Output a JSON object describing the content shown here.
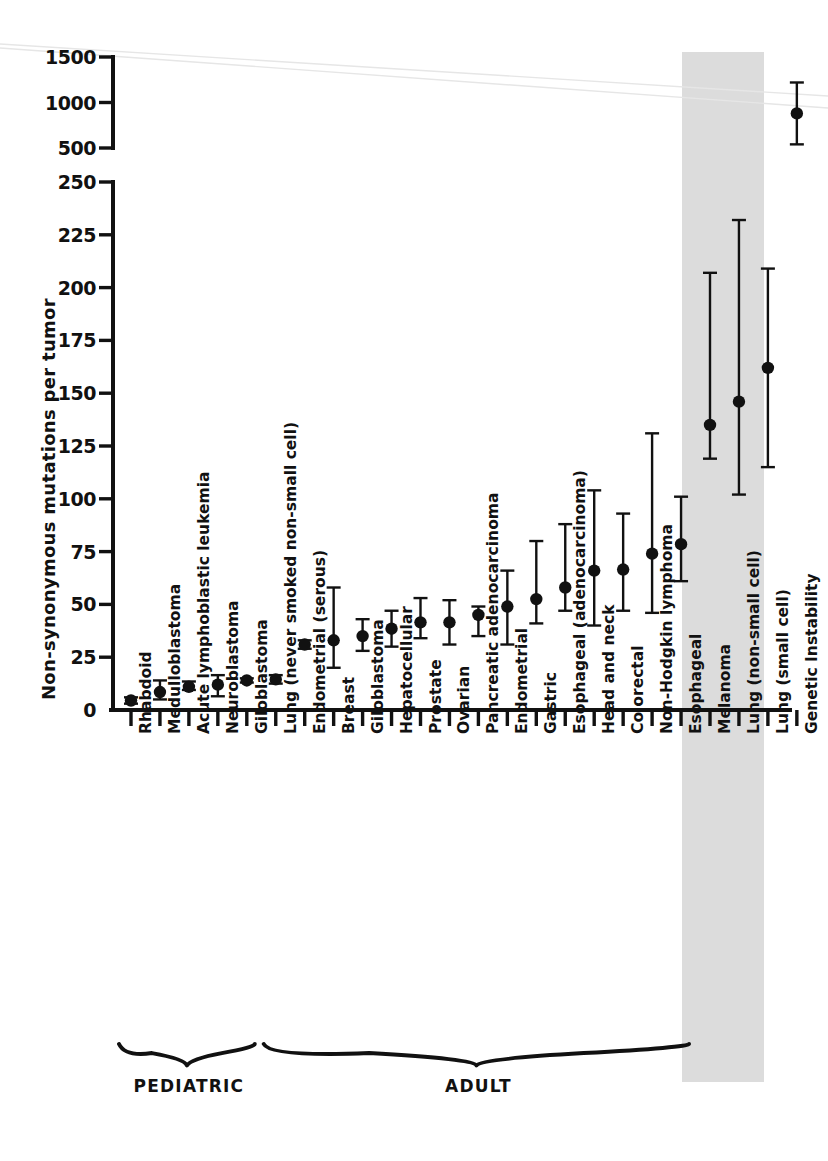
{
  "chart_data": {
    "type": "scatter",
    "title": "",
    "xlabel": "",
    "ylabel": "Non-synonymous mutations per tumor",
    "grid": false,
    "legend": "none",
    "axis_note": "broken y-axis: lower panel 0-250 (step 25), upper panel 500-1500 (step 500)",
    "lower_axis": {
      "min": 0,
      "max": 250,
      "ticks": [
        0,
        25,
        50,
        75,
        100,
        125,
        150,
        175,
        200,
        225,
        250
      ]
    },
    "upper_axis": {
      "min": 500,
      "max": 1500,
      "ticks": [
        500,
        1000,
        1500
      ]
    },
    "ytick_labels_upper": [
      "1500",
      "1000",
      "500"
    ],
    "ytick_labels_lower": [
      "250",
      "225",
      "200",
      "175",
      "150",
      "125",
      "100",
      "75",
      "50",
      "25",
      "0"
    ],
    "categories": [
      "Rhabdoid",
      "Medulloblastoma",
      "Acute lymphoblastic leukemia",
      "Neuroblastoma",
      "Giloblastoma",
      "Lung (never smoked non-small cell)",
      "Endometrial (serous)",
      "Breast",
      "Giloblastoma",
      "Hepatocellular",
      "Prostate",
      "Ovarian",
      "Pancreatic adenocarcinoma",
      "Endometrial",
      "Gastric",
      "Esophageal (adenocarcinoma)",
      "Head and neck",
      "Colorectal",
      "Non-Hodgkin lymphoma",
      "Esophageal",
      "Melanoma",
      "Lung (non-small cell)",
      "Lung (small cell)",
      "Genetic Instability"
    ],
    "values": [
      4.5,
      8.5,
      11,
      12,
      14,
      14.5,
      31,
      33,
      35,
      38.5,
      41.5,
      41.5,
      45,
      49,
      52.5,
      58,
      66,
      66.5,
      74,
      78.5,
      135,
      146,
      162,
      880
    ],
    "err_low": [
      3.0,
      5.0,
      9.5,
      6.5,
      13,
      12.5,
      29,
      20,
      28,
      30,
      34,
      31,
      35,
      31,
      41,
      47,
      40,
      47,
      46,
      61,
      119,
      102,
      115,
      540
    ],
    "err_high": [
      6.0,
      14.0,
      13.5,
      16.5,
      15,
      16.5,
      33,
      58,
      43,
      47,
      53,
      52,
      49,
      66,
      80,
      88,
      104,
      93,
      131,
      101,
      207,
      232,
      209,
      1220
    ],
    "highlight": {
      "from_index": 20,
      "to_index": 22,
      "color": "#dcdcdc"
    },
    "groups": [
      {
        "label": "PEDIATRIC",
        "from_index": 0,
        "to_index": 4
      },
      {
        "label": "ADULT",
        "from_index": 5,
        "to_index": 19
      }
    ]
  }
}
